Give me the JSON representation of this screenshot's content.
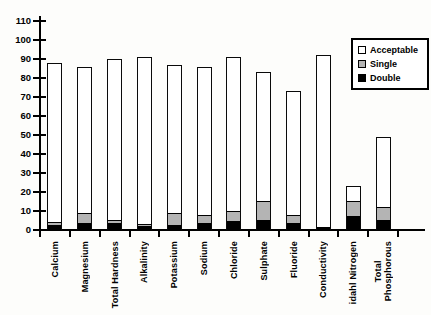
{
  "chart_data": {
    "type": "bar",
    "stacked": true,
    "title": "",
    "xlabel": "",
    "ylabel": "",
    "ylim": [
      0,
      110
    ],
    "ytick_step": 10,
    "ytick_labels": [
      "0",
      "10",
      "20",
      "30",
      "40",
      "50",
      "60",
      "70",
      "80",
      "90",
      "100",
      "110"
    ],
    "grid": false,
    "legend_position": "top-right",
    "categories": [
      "Calcium",
      "Magnesium",
      "Total Hardness",
      "Alkalinity",
      "Potassium",
      "Sodium",
      "Chloride",
      "Sulphate",
      "Fluoride",
      "Conductivity",
      "idahl Nitrogen",
      "Total\nPhosphorous"
    ],
    "series": [
      {
        "name": "Double",
        "color": "#000000",
        "values": [
          2,
          3,
          3,
          1.5,
          2,
          3,
          4,
          5,
          3,
          1,
          7,
          5
        ]
      },
      {
        "name": "Single",
        "color": "#b4b4b4",
        "values": [
          1,
          5,
          1,
          0.5,
          6,
          4,
          5,
          9,
          4,
          0,
          7,
          6
        ]
      },
      {
        "name": "Acceptable",
        "color": "#ffffff",
        "values": [
          85,
          78,
          86,
          89,
          79,
          79,
          82,
          69,
          66,
          91,
          9,
          38
        ]
      }
    ],
    "totals": [
      88,
      86,
      90,
      91,
      87,
      86,
      91,
      83,
      73,
      92,
      23,
      49
    ],
    "legend": [
      {
        "label": "Acceptable",
        "color": "#ffffff"
      },
      {
        "label": "Single",
        "color": "#b4b4b4"
      },
      {
        "label": "Double",
        "color": "#000000"
      }
    ],
    "axis_color": "#000000"
  }
}
